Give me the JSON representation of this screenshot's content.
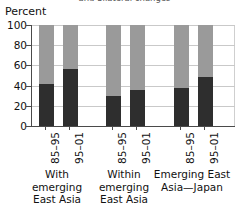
{
  "title_partial": "and bilateral changes",
  "axis": {
    "ylabel": "Percent",
    "yticks": [
      "100",
      "80",
      "60",
      "40",
      "20",
      "0"
    ]
  },
  "groups": [
    {
      "caption_lines": [
        "With",
        "emerging",
        "East Asia"
      ]
    },
    {
      "caption_lines": [
        "Within",
        "emerging",
        "East Asia"
      ]
    },
    {
      "caption_lines": [
        "Emerging East",
        "Asia—Japan"
      ]
    }
  ],
  "periods": [
    "85–95",
    "95–01",
    "85–95",
    "95–01",
    "85–95",
    "95–01"
  ],
  "colors": {
    "dark_segment": "#2e2e2e",
    "light_segment": "#9a9a9a",
    "axis": "#4a4a4a",
    "gridline": "#c9c9c9",
    "background": "#ffffff"
  },
  "chart_data": {
    "type": "bar",
    "stacked": true,
    "title": "and bilateral changes",
    "xlabel": "",
    "ylabel": "Percent",
    "ylim": [
      0,
      100
    ],
    "yticks": [
      0,
      20,
      40,
      60,
      80,
      100
    ],
    "grid": true,
    "legend": "none",
    "categories": [
      "With emerging East Asia 85–95",
      "With emerging East Asia 95–01",
      "Within emerging East Asia 85–95",
      "Within emerging East Asia 95–01",
      "Emerging East Asia—Japan 85–95",
      "Emerging East Asia—Japan 95–01"
    ],
    "groups": [
      "With emerging East Asia",
      "Within emerging East Asia",
      "Emerging East Asia—Japan"
    ],
    "periods": [
      "85–95",
      "95–01"
    ],
    "series": [
      {
        "name": "lower (dark)",
        "color": "#2e2e2e",
        "values": [
          42,
          56,
          30,
          36,
          38,
          49
        ]
      },
      {
        "name": "upper (light)",
        "color": "#9a9a9a",
        "values": [
          58,
          44,
          70,
          64,
          62,
          51
        ]
      }
    ]
  }
}
